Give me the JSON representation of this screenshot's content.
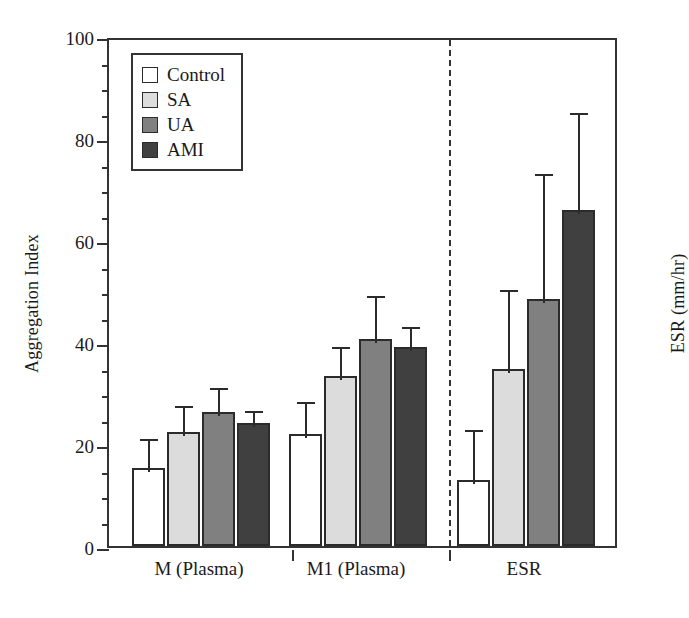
{
  "chart_data": {
    "type": "bar",
    "title": "",
    "subtitle": "",
    "xlabel": "",
    "ylabel": "Aggregation Index",
    "y2label": "ESR (mm/hr)",
    "ylim": [
      0,
      100
    ],
    "ytick_major": [
      0,
      20,
      40,
      60,
      80,
      100
    ],
    "ytick_minor_step": 5,
    "grid": false,
    "legend_position": "top-left",
    "categories": [
      "M (Plasma)",
      "M1 (Plasma)",
      "ESR"
    ],
    "series": [
      {
        "name": "Control",
        "color": "#ffffff",
        "values": [
          15.2,
          22.0,
          13.0
        ],
        "errors": [
          6.5,
          7.0,
          10.5
        ]
      },
      {
        "name": "SA",
        "color": "#dcdcdc",
        "values": [
          22.3,
          33.4,
          34.7
        ],
        "errors": [
          6.0,
          6.4,
          16.2
        ]
      },
      {
        "name": "UA",
        "color": "#808080",
        "values": [
          26.3,
          40.5,
          48.4
        ],
        "errors": [
          5.5,
          9.3,
          25.3
        ]
      },
      {
        "name": "AMI",
        "color": "#404040",
        "values": [
          24.2,
          39.0,
          65.8
        ],
        "errors": [
          3.0,
          4.8,
          19.8
        ]
      }
    ],
    "annotations": [
      {
        "type": "vertical-dashed-line",
        "between": [
          "M1 (Plasma)",
          "ESR"
        ]
      }
    ]
  },
  "legend": {
    "items": [
      {
        "label": "Control",
        "swatch": "#ffffff"
      },
      {
        "label": "SA",
        "swatch": "#dcdcdc"
      },
      {
        "label": "UA",
        "swatch": "#808080"
      },
      {
        "label": "AMI",
        "swatch": "#404040"
      }
    ]
  },
  "axes": {
    "left_title": "Aggregation Index",
    "right_title": "ESR (mm/hr)",
    "y_ticks": [
      "0",
      "20",
      "40",
      "60",
      "80",
      "100"
    ],
    "x_labels": [
      "M (Plasma)",
      "M1 (Plasma)",
      "ESR"
    ]
  }
}
